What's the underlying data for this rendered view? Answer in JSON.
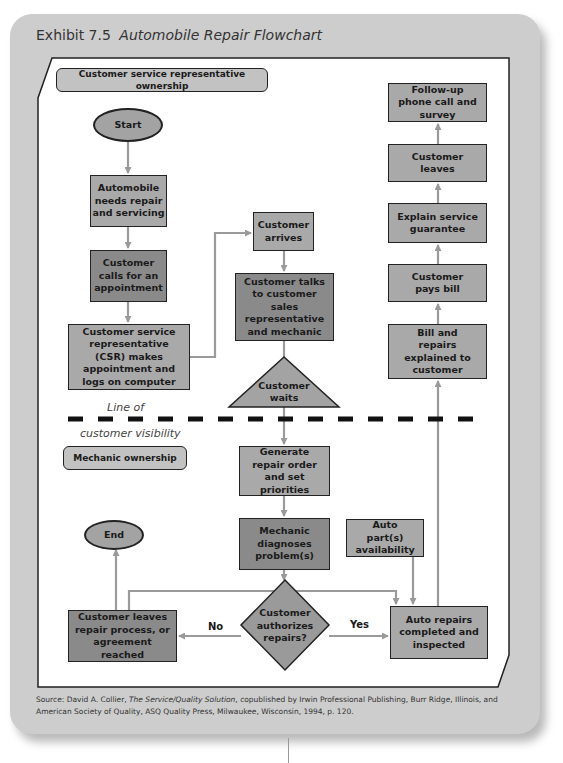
{
  "exhibit": {
    "number": "Exhibit 7.5",
    "title": "Automobile Repair Flowchart"
  },
  "lanes": {
    "csr": "Customer service representative ownership",
    "mechanic": "Mechanic ownership"
  },
  "visibility_line": {
    "top": "Line of",
    "bottom": "customer visibility"
  },
  "nodes": {
    "start": "Start",
    "end": "End",
    "needs_repair": "Automobile needs repair and servicing",
    "calls": "Customer calls for an appointment",
    "csr_appointment": "Customer service representative (CSR) makes appointment and logs on computer",
    "arrives": "Customer arrives",
    "talks": "Customer talks to customer sales representative and mechanic",
    "waits": "Customer waits",
    "generate_order": "Generate repair order and set priorities",
    "diagnoses": "Mechanic diagnoses problem(s)",
    "parts": "Auto part(s) availability",
    "authorizes": "Customer authorizes repairs?",
    "leaves_process": "Customer leaves repair process, or agreement reached",
    "repairs_done": "Auto repairs completed and inspected",
    "bill_explained": "Bill and repairs explained to customer",
    "pays_bill": "Customer pays bill",
    "guarantee": "Explain service guarantee",
    "leaves": "Customer leaves",
    "followup": "Follow-up phone call and survey"
  },
  "edge_labels": {
    "no": "No",
    "yes": "Yes"
  },
  "source": {
    "prefix": "Source: David A. Collier, ",
    "book": "The Service/Quality Solution",
    "rest": ", copublished by Irwin Professional Publishing, Burr Ridge, Illinois, and American Society of Quality, ASQ Quality Press, Milwaukee, Wisconsin, 1994, p. 120."
  },
  "colors": {
    "card": "#cdcdcd",
    "light_box": "#a9a9a9",
    "dark_box": "#8a8a8a",
    "arrow": "#9a9a9a",
    "dash": "#111111"
  }
}
